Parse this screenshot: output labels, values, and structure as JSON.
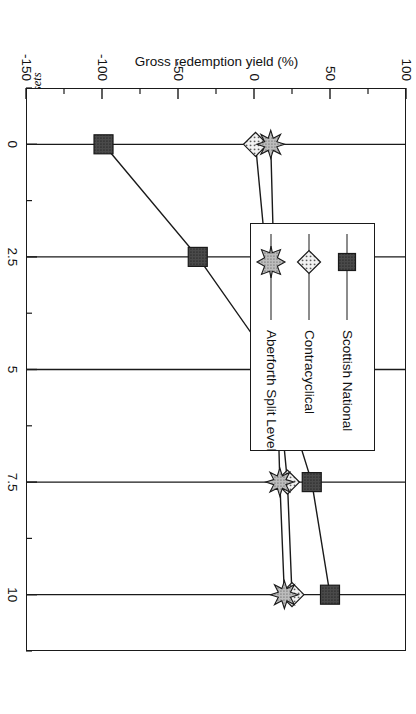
{
  "caption": {
    "figure_number": "Figure IX.7",
    "text": "Figure IX.7  Gross redemption yield of three SLIT capital shares at different growth rates of fund net assets"
  },
  "chart_data": {
    "type": "line",
    "title": "",
    "orientation": "rotated-90-clockwise",
    "xlabel": "Average Annual Growth in Fund Assets (%)",
    "ylabel": "Gross redemption yield (%)",
    "x": [
      0,
      2.5,
      5,
      7.5,
      10
    ],
    "xlim": [
      -1.25,
      11.25
    ],
    "ylim": [
      -150,
      100
    ],
    "xticks": [
      "0",
      "2.5",
      "5",
      "7.5",
      "10"
    ],
    "yticks": [
      "100",
      "50",
      "0",
      "-50",
      "-100",
      "-150"
    ],
    "ytick_values": [
      100,
      50,
      0,
      -50,
      -100,
      -150
    ],
    "minor_ticks": true,
    "grid": false,
    "legend_position": "upper right",
    "series": [
      {
        "name": "Scottish National",
        "marker": "square",
        "color": "#4d4d4d",
        "values": [
          -99,
          -37,
          15,
          38,
          50
        ]
      },
      {
        "name": "Contracyclical",
        "marker": "diamond",
        "color": "#e8e8e8",
        "values": [
          1,
          8,
          15,
          22,
          25
        ]
      },
      {
        "name": "Aberforth Split Level",
        "marker": "star",
        "color": "#b3b3b3",
        "values": [
          11,
          13,
          15,
          17,
          20
        ]
      }
    ]
  },
  "legend": {
    "entries": [
      {
        "label": "Scottish National"
      },
      {
        "label": "Contracyclical"
      },
      {
        "label": "Aberforth Split Level"
      }
    ]
  },
  "axes": {
    "x_title": "Average Annual Growth in Fund Assets (%)",
    "y_title": "Gross redemption yield (%)"
  }
}
